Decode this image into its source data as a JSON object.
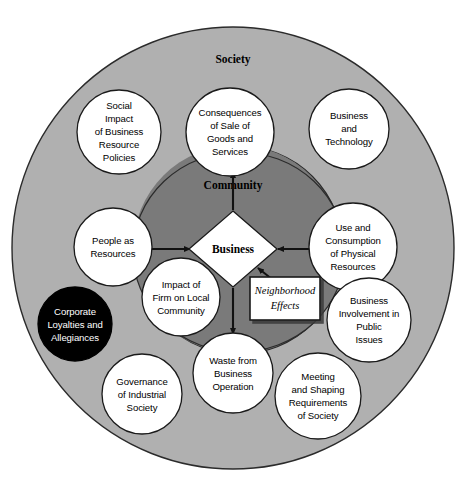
{
  "figure": {
    "type": "concentric-circle-venn-diagram",
    "colors": {
      "outer_ring_fill": "#b0b0b0",
      "inner_ring_fill": "#7a7a7a",
      "node_fill": "#ffffff",
      "highlight_node_fill": "#000000",
      "highlight_node_text": "#ffffff",
      "stroke": "#1a1a1a",
      "background": "#ffffff"
    }
  },
  "rings": [
    {
      "id": "society",
      "label": "Society",
      "label_x": 233,
      "label_y": 63
    },
    {
      "id": "community",
      "label": "Community",
      "label_x": 233,
      "label_y": 189
    }
  ],
  "core": {
    "id": "business",
    "label": "Business",
    "shape": "diamond",
    "cx": 233,
    "cy": 249,
    "rx": 44,
    "ry": 38
  },
  "callout_box": {
    "id": "neighborhood-effects",
    "lines": [
      "Neighborhood",
      "Effects"
    ],
    "x": 250,
    "y": 277,
    "width": 70,
    "height": 43
  },
  "nodes": [
    {
      "id": "social-impact-of-business-resource-policies",
      "lines": [
        "Social",
        "Impact",
        "of Business",
        "Resource",
        "Policies"
      ],
      "cx": 119,
      "cy": 132,
      "r": 42,
      "dark": false
    },
    {
      "id": "consequences-of-sale-of-goods-and-services",
      "lines": [
        "Consequences",
        "of Sale of",
        "Goods and",
        "Services"
      ],
      "cx": 230,
      "cy": 132,
      "r": 44,
      "dark": false
    },
    {
      "id": "business-and-technology",
      "lines": [
        "Business",
        "and",
        "Technology"
      ],
      "cx": 349,
      "cy": 129,
      "r": 40,
      "dark": false
    },
    {
      "id": "people-as-resources",
      "lines": [
        "People as",
        "Resources"
      ],
      "cx": 113,
      "cy": 247,
      "r": 39,
      "dark": false
    },
    {
      "id": "use-and-consumption-of-physical-resources",
      "lines": [
        "Use and",
        "Consumption",
        "of Physical",
        "Resources"
      ],
      "cx": 353,
      "cy": 247,
      "r": 44,
      "dark": false
    },
    {
      "id": "impact-of-firm-on-local-community",
      "lines": [
        "Impact of",
        "Firm on Local",
        "Community"
      ],
      "cx": 181,
      "cy": 297,
      "r": 39,
      "dark": false
    },
    {
      "id": "corporate-loyalties-and-allegiances",
      "lines": [
        "Corporate",
        "Loyalties and",
        "Allegiances"
      ],
      "cx": 75,
      "cy": 324,
      "r": 37,
      "dark": true
    },
    {
      "id": "business-involvement-in-public-issues",
      "lines": [
        "Business",
        "Involvement in",
        "Public",
        "Issues"
      ],
      "cx": 369,
      "cy": 320,
      "r": 42,
      "dark": false
    },
    {
      "id": "waste-from-business-operation",
      "lines": [
        "Waste from",
        "Business",
        "Operation"
      ],
      "cx": 233,
      "cy": 373,
      "r": 40,
      "dark": false
    },
    {
      "id": "governance-of-industrial-society",
      "lines": [
        "Governance",
        "of Industrial",
        "Society"
      ],
      "cx": 142,
      "cy": 394,
      "r": 40,
      "dark": false
    },
    {
      "id": "meeting-and-shaping-requirements-of-society",
      "lines": [
        "Meeting",
        "and Shaping",
        "Requirements",
        "of Society"
      ],
      "cx": 318,
      "cy": 396,
      "r": 43,
      "dark": false
    }
  ],
  "arrows": [
    {
      "id": "arrow-business-to-consequences",
      "direction": "up"
    },
    {
      "id": "arrow-people-to-business",
      "direction": "right"
    },
    {
      "id": "arrow-use-consumption-to-business",
      "direction": "left"
    },
    {
      "id": "arrow-business-to-waste",
      "direction": "down"
    },
    {
      "id": "arrow-neighborhood-effects-to-business",
      "direction": "up-left"
    }
  ]
}
